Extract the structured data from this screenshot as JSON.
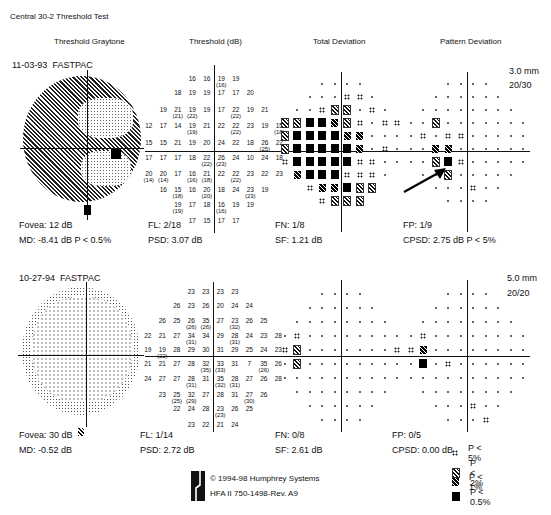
{
  "header": {
    "title": "Central 30-2 Threshold Test",
    "columns": [
      "Threshold Graytone",
      "Threshold (dB)",
      "Total Deviation",
      "Pattern Deviation"
    ]
  },
  "tests": [
    {
      "date": "11-03-93",
      "strategy": "FASTPAC",
      "pupil": "3.0 mm",
      "visual_acuity": "20/30",
      "fovea": "Fovea: 12 dB",
      "md": "MD:  -8.41 dB  P < 0.5%",
      "fl": "FL: 2/18",
      "psd": "PSD:  3.07 dB",
      "fn": "FN: 1/8",
      "sf": "SF:   1.21 dB",
      "fp": "FP: 1/9",
      "cpsd": "CPSD:  2.75 dB  P < 5%",
      "threshold_rows": [
        {
          "y": 79,
          "cells": [
            [
              -2,
              "16"
            ],
            [
              -1,
              "16"
            ],
            [
              1,
              "19",
              "(16)"
            ],
            [
              2,
              "19"
            ]
          ]
        },
        {
          "y": 93,
          "cells": [
            [
              -3,
              "18"
            ],
            [
              -2,
              "19"
            ],
            [
              -1,
              "19"
            ],
            [
              1,
              "17"
            ],
            [
              2,
              "17"
            ],
            [
              3,
              "20"
            ]
          ]
        },
        {
          "y": 110,
          "cells": [
            [
              -4,
              "19"
            ],
            [
              -3,
              "21",
              "(21)"
            ],
            [
              -2,
              "19",
              "(22)"
            ],
            [
              -1,
              "19"
            ],
            [
              1,
              "17"
            ],
            [
              2,
              "22",
              "(22)"
            ],
            [
              3,
              "19"
            ],
            [
              4,
              "21"
            ]
          ]
        },
        {
          "y": 126,
          "cells": [
            [
              -5,
              "12"
            ],
            [
              -4,
              "17"
            ],
            [
              -3,
              "14"
            ],
            [
              -2,
              "19",
              "(19)"
            ],
            [
              -1,
              "21"
            ],
            [
              1,
              "22"
            ],
            [
              2,
              "22",
              "(22)"
            ],
            [
              3,
              "23"
            ],
            [
              4,
              "19"
            ],
            [
              5,
              "15",
              "(18)"
            ]
          ]
        },
        {
          "y": 143,
          "cells": [
            [
              -5,
              "15"
            ],
            [
              -4,
              "15"
            ],
            [
              -3,
              "21"
            ],
            [
              -2,
              "19"
            ],
            [
              -1,
              "20"
            ],
            [
              1,
              "24"
            ],
            [
              2,
              "22"
            ],
            [
              3,
              "18"
            ],
            [
              4,
              "26",
              "(25)"
            ],
            [
              5,
              "22"
            ]
          ]
        },
        {
          "y": 158,
          "cells": [
            [
              -5,
              "17"
            ],
            [
              -4,
              "17"
            ],
            [
              -3,
              "17"
            ],
            [
              -2,
              "18"
            ],
            [
              -1,
              "22",
              "(22)"
            ],
            [
              1,
              "26",
              "(23)"
            ],
            [
              2,
              "24"
            ],
            [
              3,
              "10"
            ],
            [
              4,
              "24"
            ],
            [
              5,
              "18"
            ]
          ]
        },
        {
          "y": 174,
          "cells": [
            [
              -5,
              "20",
              "(14)"
            ],
            [
              -4,
              "20",
              "(14)"
            ],
            [
              -3,
              "17"
            ],
            [
              -2,
              "16",
              "(16)"
            ],
            [
              -1,
              "21",
              "(18)"
            ],
            [
              1,
              "22"
            ],
            [
              2,
              "22",
              "(22)"
            ],
            [
              3,
              "23"
            ],
            [
              4,
              "22"
            ],
            [
              5,
              "23"
            ]
          ]
        },
        {
          "y": 190,
          "cells": [
            [
              -4,
              "16"
            ],
            [
              -3,
              "15",
              "(18)"
            ],
            [
              -2,
              "16"
            ],
            [
              -1,
              "20",
              "(20)"
            ],
            [
              1,
              "18"
            ],
            [
              2,
              "24"
            ],
            [
              3,
              "23",
              "(23)"
            ],
            [
              4,
              "19"
            ]
          ]
        },
        {
          "y": 205,
          "cells": [
            [
              -3,
              "19",
              "(19)"
            ],
            [
              -2,
              "17"
            ],
            [
              -1,
              "18"
            ],
            [
              1,
              "16",
              "(16)"
            ],
            [
              2,
              "19"
            ],
            [
              3,
              "19"
            ]
          ]
        },
        {
          "y": 221,
          "cells": [
            [
              -2,
              "17"
            ],
            [
              -1,
              "15"
            ],
            [
              1,
              "17"
            ],
            [
              2,
              "17"
            ]
          ]
        }
      ]
    },
    {
      "date": "10-27-94",
      "strategy": "FASTPAC",
      "pupil": "5.0 mm",
      "visual_acuity": "20/20",
      "fovea": "Fovea: 30 dB",
      "md": "MD:  -0.52 dB",
      "fl": "FL: 1/14",
      "psd": "PSD:  2.72 dB",
      "fn": "FN: 0/8",
      "sf": "SF:   2.61 dB",
      "fp": "FP: 0/5",
      "cpsd": "CPSD:  0.00 dB",
      "threshold_rows": [
        {
          "y": 292,
          "cells": [
            [
              -2,
              "23"
            ],
            [
              -1,
              "23"
            ],
            [
              1,
              "23"
            ],
            [
              2,
              "23"
            ]
          ]
        },
        {
          "y": 306,
          "cells": [
            [
              -3,
              "26"
            ],
            [
              -2,
              "23"
            ],
            [
              -1,
              "26"
            ],
            [
              1,
              "20"
            ],
            [
              2,
              "24"
            ],
            [
              3,
              "24"
            ]
          ]
        },
        {
          "y": 321,
          "cells": [
            [
              -4,
              "26"
            ],
            [
              -3,
              "25"
            ],
            [
              -2,
              "26",
              "(26)"
            ],
            [
              -1,
              "35",
              "(26)"
            ],
            [
              1,
              "27"
            ],
            [
              2,
              "23",
              "(32)"
            ],
            [
              3,
              "26"
            ],
            [
              4,
              "25"
            ]
          ]
        },
        {
          "y": 336,
          "cells": [
            [
              -5,
              "22"
            ],
            [
              -4,
              "21"
            ],
            [
              -3,
              "27"
            ],
            [
              -2,
              "34",
              "(31)"
            ],
            [
              -1,
              "34"
            ],
            [
              1,
              "29"
            ],
            [
              2,
              "28",
              "(31)"
            ],
            [
              3,
              "24"
            ],
            [
              4,
              "23"
            ],
            [
              5,
              "28"
            ]
          ]
        },
        {
          "y": 350,
          "cells": [
            [
              -5,
              "19"
            ],
            [
              -4,
              "19",
              "(22)"
            ],
            [
              -3,
              "28"
            ],
            [
              -2,
              "29"
            ],
            [
              -1,
              "30"
            ],
            [
              1,
              "31"
            ],
            [
              2,
              "29"
            ],
            [
              3,
              "25"
            ],
            [
              4,
              "24"
            ],
            [
              5,
              "23"
            ]
          ]
        },
        {
          "y": 364,
          "cells": [
            [
              -5,
              "21"
            ],
            [
              -4,
              "21"
            ],
            [
              -3,
              "27"
            ],
            [
              -2,
              "28"
            ],
            [
              -1,
              "32",
              "(35)"
            ],
            [
              1,
              "33",
              "(33)"
            ],
            [
              2,
              "31"
            ],
            [
              3,
              "7"
            ],
            [
              4,
              "35",
              "(26)"
            ],
            [
              5,
              "26"
            ]
          ]
        },
        {
          "y": 379,
          "cells": [
            [
              -5,
              "24"
            ],
            [
              -4,
              "27"
            ],
            [
              -3,
              "27"
            ],
            [
              -2,
              "28",
              "(31)"
            ],
            [
              -1,
              "31"
            ],
            [
              1,
              "35",
              "(32)"
            ],
            [
              2,
              "28",
              "(31)"
            ],
            [
              3,
              "27"
            ],
            [
              4,
              "26"
            ],
            [
              5,
              "28"
            ]
          ]
        },
        {
          "y": 395,
          "cells": [
            [
              -4,
              "23"
            ],
            [
              -3,
              "25",
              "(25)"
            ],
            [
              -2,
              "32",
              "(29)"
            ],
            [
              -1,
              "27"
            ],
            [
              1,
              "28"
            ],
            [
              2,
              "31"
            ],
            [
              3,
              "27",
              "(30)"
            ],
            [
              4,
              "26"
            ]
          ]
        },
        {
          "y": 409,
          "cells": [
            [
              -3,
              "22"
            ],
            [
              -2,
              "24"
            ],
            [
              -1,
              "28"
            ],
            [
              1,
              "23",
              "(23)"
            ],
            [
              2,
              "26"
            ],
            [
              3,
              "25"
            ]
          ]
        },
        {
          "y": 425,
          "cells": [
            [
              -2,
              "23"
            ],
            [
              -1,
              "22"
            ],
            [
              1,
              "21"
            ],
            [
              2,
              "24"
            ]
          ]
        }
      ]
    }
  ],
  "deviation_plots": {
    "row_counts": [
      4,
      6,
      8,
      10,
      10,
      10,
      10,
      8,
      6,
      4
    ],
    "test1_total": [
      ".,.,.,.",
      ".,.,.,s5,s5,.",
      ".,.,s5,s2,s2,.,s5,.",
      "s2,s2,s05,s05,s1,s2,s5,.,s5,s5",
      "s2,s05,s05,s05,s05,s1,s1,.,.,.",
      "s2,s05,s05,s05,s05,s05,s1,.,s5,.",
      "s5,s05,s05,s05,s05,s05,s5,s5,.,.",
      "s1,s05,s05,s05,s5,s5,s5,.",
      "s5,s1,s1,s05,s2,s2",
      "s5,s2,s2,s2"
    ],
    "test1_pattern": [
      ".,.,.,.",
      ".,.,.,.,.,.",
      ".,.,.,.,.,.,.,.",
      ".,.,s2,.,.,.,.,.,.,.",
      ".,s5,.,s5,s5,.,.,.,.,.",
      ".,.,s1,s1,.,.,.,.,.,.",
      ".,.,s2,s05,s5,.,.,.,.,.",
      ".,.,s2,.,.,.,.,.",
      ".,.,.,s5,.,.",
      ".,.,.,."
    ],
    "test2_total": [
      ".,.,.,.",
      ".,.,.,.,.,.",
      ".,.,.,.,.,.,.,.",
      ".,s5,.,.,.,.,.,.,.,.",
      "s5,s2,.,.,.,.,.,.,.,s5",
      ".,s2,.,.,.,.,.,.,.,.",
      ".,.,.,.,.,.,.,.,.,.",
      ".,.,.,.,.,.,.,.",
      ".,.,.,.,.,.",
      ".,.,.,."
    ],
    "test2_pattern": [
      ".,.,.,.",
      ".,.,.,.,.,.",
      ".,.,.,.,.,.,.,.",
      ".,s5,.,.,.,.,.,.,.,.",
      "s5,s1,.,.,.,.,.,.,.,.",
      ".,s05,.,s5,.,.,.,.,.,.",
      ".,.,.,.,.,.,.,.,.,.",
      ".,.,.,.,.,.,.,.",
      ".,.,.,s5,.,.",
      ".,.,.,s5"
    ]
  },
  "legend": {
    "items": [
      {
        "symbol": "s5",
        "label": "P < 5%"
      },
      {
        "symbol": "s2",
        "label": "P < 2%"
      },
      {
        "symbol": "s1",
        "label": "P < 1%"
      },
      {
        "symbol": "s05",
        "label": "P < 0.5%"
      }
    ]
  },
  "footer": {
    "copyright": "© 1994-98 Humphrey Systems",
    "model": "HFA II 750-1498-Rev. A9"
  },
  "icons": {
    "logo": "humphrey-logo-icon",
    "arrow": "annotation-arrow-icon"
  }
}
